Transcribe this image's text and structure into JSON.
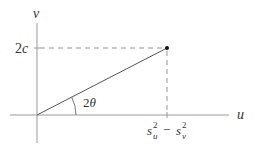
{
  "diagram": {
    "axes": {
      "horizontal_label": "u",
      "vertical_label": "v"
    },
    "point": {
      "y_label_coef": "2",
      "y_label_var": "c",
      "x_label": {
        "s1": "s",
        "s1_sub": "u",
        "s1_sup": "2",
        "minus": "−",
        "s2": "s",
        "s2_sub": "v",
        "s2_sup": "2"
      }
    },
    "angle": {
      "coef": "2",
      "var": "θ"
    },
    "colors": {
      "axis": "#999999",
      "line": "#555555",
      "dash": "#777777",
      "point": "#111111",
      "text": "#333333"
    }
  }
}
